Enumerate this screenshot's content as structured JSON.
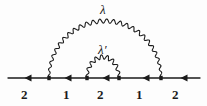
{
  "diagram": {
    "type": "feynman-diagram",
    "background_color": "#fdfdfd",
    "line_color": "#1b1b1b",
    "fermion_line": {
      "name": "fermion-line",
      "y": 78,
      "x_start": 8,
      "x_end": 200,
      "arrow_direction": "left",
      "arrow_positions": [
        30,
        70,
        108,
        148,
        186
      ]
    },
    "vertices": [
      {
        "id": "v1",
        "x": 49,
        "y": 78
      },
      {
        "id": "v2",
        "x": 87,
        "y": 78
      },
      {
        "id": "v3",
        "x": 119,
        "y": 78
      },
      {
        "id": "v4",
        "x": 161,
        "y": 78
      }
    ],
    "photons": [
      {
        "id": "outer-photon",
        "label": "λ",
        "from_vertex": "v1",
        "to_vertex": "v4",
        "apex_y": 21,
        "wiggle_count": 26
      },
      {
        "id": "inner-photon",
        "label": "λ′",
        "from_vertex": "v2",
        "to_vertex": "v3",
        "apex_y": 57,
        "wiggle_count": 9
      }
    ],
    "photon_labels": [
      {
        "name": "outer-photon-label",
        "text": "λ",
        "x": 100,
        "y": 3
      },
      {
        "name": "inner-photon-label",
        "text": "λ′",
        "x": 98,
        "y": 43
      }
    ],
    "segment_labels": [
      {
        "name": "segment-label-1",
        "text": "2",
        "x": 21,
        "y": 88
      },
      {
        "name": "segment-label-2",
        "text": "1",
        "x": 63,
        "y": 88
      },
      {
        "name": "segment-label-3",
        "text": "2",
        "x": 97,
        "y": 88
      },
      {
        "name": "segment-label-4",
        "text": "1",
        "x": 136,
        "y": 88
      },
      {
        "name": "segment-label-5",
        "text": "2",
        "x": 172,
        "y": 88
      }
    ]
  }
}
